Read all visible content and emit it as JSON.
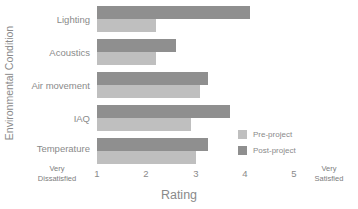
{
  "chart_data": {
    "type": "bar",
    "orientation": "horizontal",
    "title": "",
    "xlabel": "Rating",
    "ylabel": "Environmental Condition",
    "categories": [
      "Lighting",
      "Acoustics",
      "Air movement",
      "IAQ",
      "Temperature"
    ],
    "series": [
      {
        "name": "Pre-project",
        "values": [
          3.25,
          2.2,
          3.1,
          2.9,
          3.0
        ],
        "color": "#bfbfbf"
      },
      {
        "name": "Post-project",
        "values": [
          4.1,
          2.6,
          3.25,
          3.7,
          3.25
        ],
        "color": "#8f8f8f"
      }
    ],
    "xlim": [
      1,
      5
    ],
    "xticks": [
      "1",
      "2",
      "3",
      "4",
      "5"
    ],
    "x_axis_low_label": "Very\nDissatisfied",
    "x_axis_high_label": "Very\nSatisfied",
    "grid": false,
    "legend_position": "inside-bottom-right"
  },
  "axes": {
    "y_title": "Environmental Condition",
    "x_title": "Rating",
    "x_low_line1": "Very",
    "x_low_line2": "Dissatisfied",
    "x_high_line1": "Very",
    "x_high_line2": "Satisfied",
    "x_tick_1": "1",
    "x_tick_2": "2",
    "x_tick_3": "3",
    "x_tick_4": "4",
    "x_tick_5": "5"
  },
  "categories": {
    "c0": "Lighting",
    "c1": "Acoustics",
    "c2": "Air movement",
    "c3": "IAQ",
    "c4": "Temperature"
  },
  "legend": {
    "pre_label": "Pre-project",
    "post_label": "Post-project"
  },
  "colors": {
    "pre": "#bfbfbf",
    "post": "#8f8f8f",
    "text": "#8a8a8a",
    "background": "#ffffff"
  }
}
